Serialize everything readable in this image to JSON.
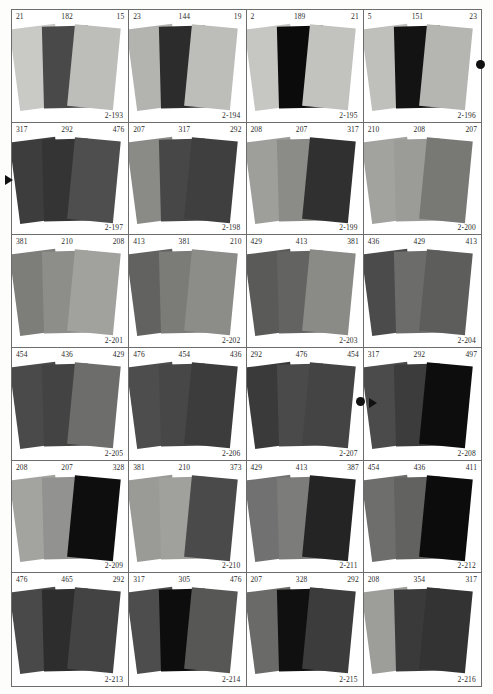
{
  "sheet": {
    "title": "Color sample chart sheet",
    "grid": {
      "columns": 4,
      "rows": 6
    },
    "palette": {
      "paper_white": "#fdfdfc",
      "cell_background": "#ffffff",
      "rule_color": "#6d6d6d",
      "text_color": "#2a2a2a",
      "marker_color": "#111111"
    }
  },
  "cells": [
    {
      "code": "2-193",
      "left": "21",
      "mid": "182",
      "right": "15",
      "swatches": [
        "#c9c9c6",
        "#494949",
        "#bdbdb9"
      ]
    },
    {
      "code": "2-194",
      "left": "23",
      "mid": "144",
      "right": "19",
      "swatches": [
        "#b3b3af",
        "#2c2c2c",
        "#bdbdb9"
      ]
    },
    {
      "code": "2-195",
      "left": "2",
      "mid": "189",
      "right": "21",
      "swatches": [
        "#c6c6c2",
        "#0b0b0b",
        "#c2c2be"
      ]
    },
    {
      "code": "2-196",
      "left": "5",
      "mid": "151",
      "right": "23",
      "swatches": [
        "#bfbfbb",
        "#131313",
        "#b5b5b1"
      ]
    },
    {
      "code": "2-197",
      "left": "317",
      "mid": "292",
      "right": "476",
      "swatches": [
        "#3d3d3d",
        "#343434",
        "#4e4e4e"
      ]
    },
    {
      "code": "2-198",
      "left": "207",
      "mid": "317",
      "right": "292",
      "swatches": [
        "#8a8a86",
        "#474747",
        "#3f3f3f"
      ]
    },
    {
      "code": "2-199",
      "left": "208",
      "mid": "207",
      "right": "317",
      "swatches": [
        "#9e9e9a",
        "#8b8b87",
        "#303030"
      ]
    },
    {
      "code": "2-200",
      "left": "210",
      "mid": "208",
      "right": "207",
      "swatches": [
        "#a2a29e",
        "#9b9b97",
        "#787874"
      ]
    },
    {
      "code": "2-201",
      "left": "381",
      "mid": "210",
      "right": "208",
      "swatches": [
        "#7d7d79",
        "#8d8d89",
        "#a1a19d"
      ]
    },
    {
      "code": "2-202",
      "left": "413",
      "mid": "381",
      "right": "210",
      "swatches": [
        "#626260",
        "#7b7b77",
        "#8c8c88"
      ]
    },
    {
      "code": "2-203",
      "left": "429",
      "mid": "413",
      "right": "381",
      "swatches": [
        "#5a5a58",
        "#636361",
        "#8a8a86"
      ]
    },
    {
      "code": "2-204",
      "left": "436",
      "mid": "429",
      "right": "413",
      "swatches": [
        "#4b4b4b",
        "#6c6c6a",
        "#5d5d5b"
      ]
    },
    {
      "code": "2-205",
      "left": "454",
      "mid": "436",
      "right": "429",
      "swatches": [
        "#4a4a4a",
        "#434343",
        "#6d6d6b"
      ]
    },
    {
      "code": "2-206",
      "left": "476",
      "mid": "454",
      "right": "436",
      "swatches": [
        "#4d4d4d",
        "#474747",
        "#3c3c3c"
      ]
    },
    {
      "code": "2-207",
      "left": "292",
      "mid": "476",
      "right": "454",
      "swatches": [
        "#3a3a3a",
        "#4a4a4a",
        "#444444"
      ]
    },
    {
      "code": "2-208",
      "left": "317",
      "mid": "292",
      "right": "497",
      "swatches": [
        "#4b4b4b",
        "#3c3c3c",
        "#0d0d0d"
      ]
    },
    {
      "code": "2-209",
      "left": "208",
      "mid": "207",
      "right": "328",
      "swatches": [
        "#a3a39f",
        "#929290",
        "#0e0e0e"
      ]
    },
    {
      "code": "2-210",
      "left": "381",
      "mid": "210",
      "right": "373",
      "swatches": [
        "#9a9a96",
        "#a0a09c",
        "#4a4a4a"
      ]
    },
    {
      "code": "2-211",
      "left": "429",
      "mid": "413",
      "right": "387",
      "swatches": [
        "#717171",
        "#7c7c7a",
        "#242424"
      ]
    },
    {
      "code": "2-212",
      "left": "454",
      "mid": "436",
      "right": "411",
      "swatches": [
        "#6e6e6c",
        "#626260",
        "#0c0c0c"
      ]
    },
    {
      "code": "2-213",
      "left": "476",
      "mid": "465",
      "right": "292",
      "swatches": [
        "#494949",
        "#2d2d2d",
        "#434343"
      ]
    },
    {
      "code": "2-214",
      "left": "317",
      "mid": "305",
      "right": "476",
      "swatches": [
        "#4d4d4d",
        "#0d0d0d",
        "#575755"
      ]
    },
    {
      "code": "2-215",
      "left": "207",
      "mid": "328",
      "right": "292",
      "swatches": [
        "#6a6a68",
        "#101010",
        "#3c3c3c"
      ]
    },
    {
      "code": "2-216",
      "left": "208",
      "mid": "354",
      "right": "317",
      "swatches": [
        "#9d9d99",
        "#3a3a3a",
        "#333333"
      ]
    }
  ],
  "markers": [
    {
      "name": "marker-triangle-row2-left",
      "shape": "triangle",
      "x": 5,
      "y": 175
    },
    {
      "name": "marker-dot-row1-right",
      "shape": "dot",
      "x": 476,
      "y": 60
    },
    {
      "name": "marker-dot-row4-mid",
      "shape": "dot",
      "x": 356,
      "y": 397
    },
    {
      "name": "marker-triangle-row4-mid",
      "shape": "triangle",
      "x": 369,
      "y": 398
    }
  ]
}
